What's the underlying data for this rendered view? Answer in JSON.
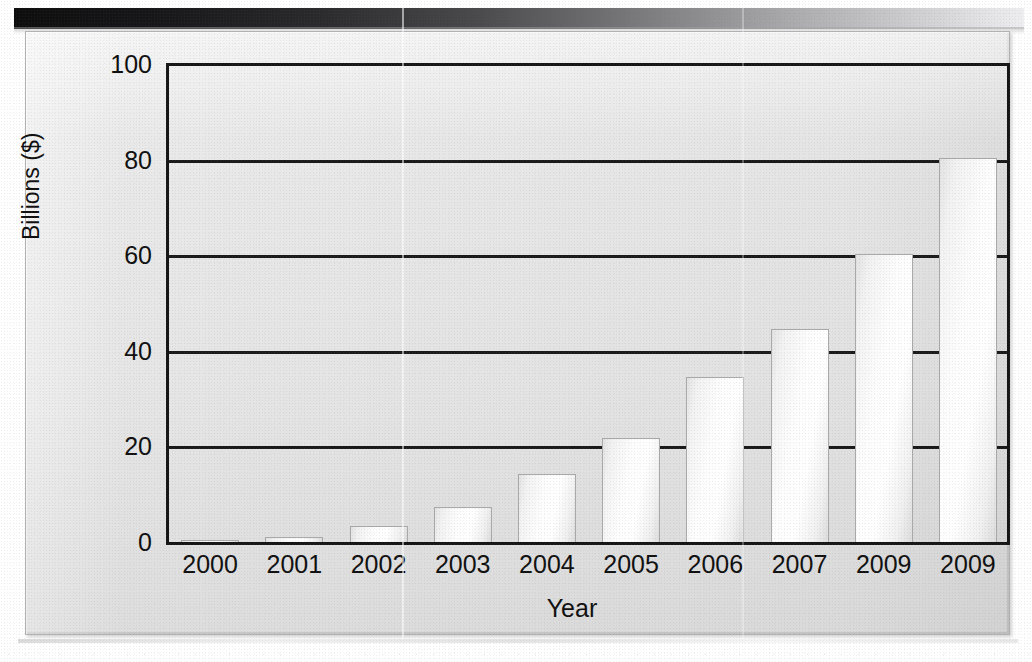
{
  "document": {
    "kind": "scanned-bar-chart",
    "page_background": "#ffffff",
    "frame_background": "#e9e9e9",
    "ink_color": "#101010",
    "bar_fill": "#fbfbfb",
    "bar_outline": "#a9a9a9"
  },
  "chart_data": {
    "type": "bar",
    "title": "",
    "xlabel": "Year",
    "ylabel": "Billions ($)",
    "categories": [
      "2000",
      "2001",
      "2002",
      "2003",
      "2004",
      "2005",
      "2006",
      "2007",
      "2009",
      "2009"
    ],
    "values": [
      0.5,
      1.3,
      3.5,
      7.5,
      14.4,
      22.0,
      34.7,
      44.8,
      60.5,
      80.5
    ],
    "ylim": [
      0,
      100
    ],
    "yticks": [
      "0",
      "20",
      "40",
      "60",
      "80",
      "100"
    ],
    "ytick_values": [
      0,
      20,
      40,
      60,
      80,
      100
    ],
    "grid": true,
    "grid_axis": "y",
    "legend": null,
    "legend_position": "none",
    "series": [
      {
        "name": "Billions ($)",
        "values": [
          0.5,
          1.3,
          3.5,
          7.5,
          14.4,
          22.0,
          34.7,
          44.8,
          60.5,
          80.5
        ]
      }
    ]
  }
}
